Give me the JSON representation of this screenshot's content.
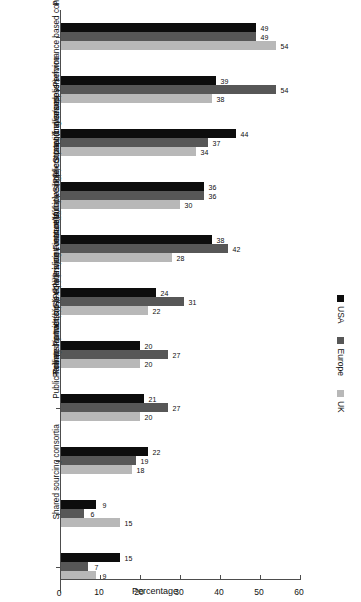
{
  "chart_data": {
    "type": "bar",
    "title": "",
    "subtitle": "",
    "orientation": "vertical-rotated",
    "xlabel": "",
    "ylabel": "Percentage",
    "ylim": [
      0,
      60
    ],
    "yticks": [
      0,
      10,
      20,
      30,
      40,
      50,
      60
    ],
    "grid": false,
    "legend_position": "top",
    "categories": [
      "Preferred/trusted supplier(s)",
      "Partnerships (joint risks/liabilities and rewards)",
      "Performance based contract(s)",
      "Strategic alliances",
      "Single contract (buyer/supplier)",
      "Multiple suppliers providing seamless service",
      "Flexible pricing contract(s)",
      "Rolling contract(s)",
      "Partnership with cross equities/joint venture(s)",
      "Public-Private Partnership (PPP)/Private Finance Initiative (PFI)",
      "Shared sourcing consortia"
    ],
    "series": [
      {
        "name": "USA",
        "color": "#0d0d0d",
        "values": [
          49,
          39,
          44,
          36,
          38,
          24,
          20,
          21,
          22,
          9,
          15
        ]
      },
      {
        "name": "Europe",
        "color": "#575757",
        "values": [
          49,
          54,
          37,
          36,
          42,
          31,
          27,
          27,
          19,
          6,
          7
        ]
      },
      {
        "name": "UK",
        "color": "#b8b8b8",
        "values": [
          54,
          38,
          34,
          30,
          28,
          22,
          20,
          20,
          18,
          15,
          9
        ]
      }
    ]
  },
  "legend": {
    "entries": [
      {
        "label": "USA",
        "color": "#0d0d0d"
      },
      {
        "label": "Europe",
        "color": "#575757"
      },
      {
        "label": "UK",
        "color": "#b8b8b8"
      }
    ]
  },
  "axis": {
    "value_axis_title": "Percentage",
    "tick_labels": [
      "0",
      "10",
      "20",
      "30",
      "40",
      "50",
      "60"
    ]
  }
}
